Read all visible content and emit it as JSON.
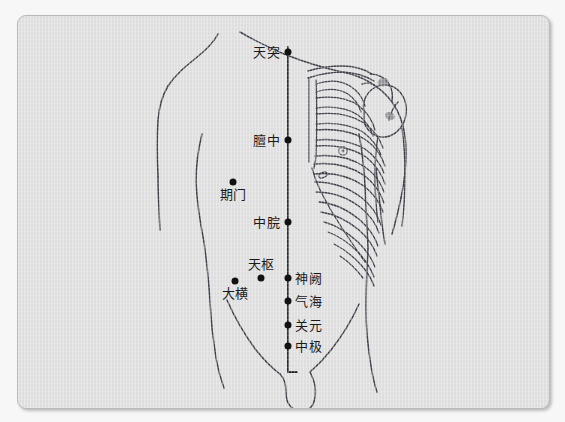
{
  "figure": {
    "kind": "anatomical-acupuncture-chart",
    "region": "anterior-torso",
    "panel_bg": "#dedede",
    "outer_bg": "#f7f7f7",
    "border_color": "#b9b9b9",
    "ink_color": "#3a3a42",
    "dot_color": "#111111"
  },
  "meridian": {
    "name": "midline",
    "x": 287,
    "y_top": 48,
    "y_bottom": 362
  },
  "points": [
    {
      "id": "tiantu",
      "label": "天突",
      "dot_x": 287,
      "dot_y": 51,
      "label_x": 280,
      "label_y": 51,
      "side": "left"
    },
    {
      "id": "danzhong",
      "label": "膻中",
      "dot_x": 287,
      "dot_y": 139,
      "label_x": 280,
      "label_y": 139,
      "side": "left"
    },
    {
      "id": "qimen",
      "label": "期门",
      "dot_x": 232,
      "dot_y": 181,
      "label_x": 232,
      "label_y": 186,
      "side": "below"
    },
    {
      "id": "zhongwan",
      "label": "中脘",
      "dot_x": 287,
      "dot_y": 221,
      "label_x": 280,
      "label_y": 221,
      "side": "left"
    },
    {
      "id": "tianshu",
      "label": "天枢",
      "dot_x": 260,
      "dot_y": 277,
      "label_x": 260,
      "label_y": 263,
      "side": "above"
    },
    {
      "id": "daheng",
      "label": "大横",
      "dot_x": 234,
      "dot_y": 280,
      "label_x": 234,
      "label_y": 286,
      "side": "below"
    },
    {
      "id": "shenque",
      "label": "神阙",
      "dot_x": 287,
      "dot_y": 277,
      "label_x": 295,
      "label_y": 277,
      "side": "right"
    },
    {
      "id": "qihai",
      "label": "气海",
      "dot_x": 287,
      "dot_y": 300,
      "label_x": 295,
      "label_y": 300,
      "side": "right"
    },
    {
      "id": "guanyuan",
      "label": "关元",
      "dot_x": 287,
      "dot_y": 324,
      "label_x": 295,
      "label_y": 324,
      "side": "right"
    },
    {
      "id": "zhongji",
      "label": "中极",
      "dot_x": 287,
      "dot_y": 345,
      "label_x": 295,
      "label_y": 345,
      "side": "right"
    }
  ]
}
